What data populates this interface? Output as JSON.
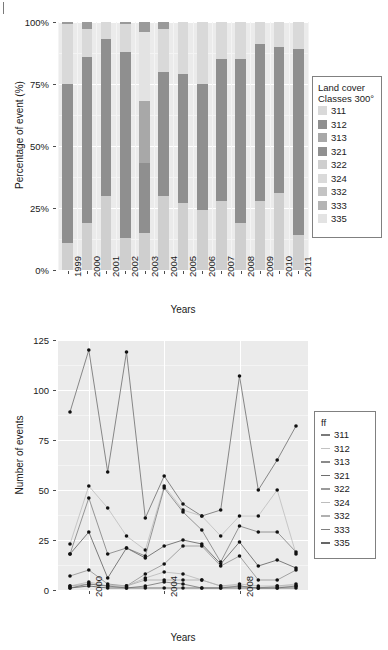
{
  "figure": {
    "corner_mark": "|"
  },
  "bar_chart": {
    "ylabel": "Percentage of event (%)",
    "xlabel": "Years",
    "ytick_labels": [
      "0%",
      "25%",
      "50%",
      "75%",
      "100%"
    ],
    "legend": {
      "title_line1": "Land cover",
      "title_line2": "Classes 300°",
      "items": [
        {
          "label": "311",
          "color": "#d9d9d9"
        },
        {
          "label": "312",
          "color": "#8f8f8f"
        },
        {
          "label": "313",
          "color": "#a8a8a8"
        },
        {
          "label": "321",
          "color": "#909090"
        },
        {
          "label": "322",
          "color": "#cfcfcf"
        },
        {
          "label": "324",
          "color": "#dadada"
        },
        {
          "label": "332",
          "color": "#c4c4c4"
        },
        {
          "label": "333",
          "color": "#b4b4b4"
        },
        {
          "label": "335",
          "color": "#e3e3e3"
        }
      ]
    }
  },
  "line_chart": {
    "ylabel": "Number of events",
    "xlabel": "Years",
    "ytick_labels": [
      "0",
      "25",
      "50",
      "75",
      "100",
      "125"
    ],
    "xtick_labels": [
      "2000",
      "2004",
      "2008"
    ],
    "legend": {
      "title": "ff",
      "items": [
        {
          "label": "311",
          "color": "#7a7a7a"
        },
        {
          "label": "312",
          "color": "#c2c2c2"
        },
        {
          "label": "313",
          "color": "#8a8a8a"
        },
        {
          "label": "321",
          "color": "#6e6e6e"
        },
        {
          "label": "322",
          "color": "#9a9a9a"
        },
        {
          "label": "324",
          "color": "#bdbdbd"
        },
        {
          "label": "332",
          "color": "#b0b0b0"
        },
        {
          "label": "333",
          "color": "#7f7f7f"
        },
        {
          "label": "335",
          "color": "#666666"
        }
      ]
    }
  },
  "chart_data": [
    {
      "type": "bar",
      "id": "stacked-percent-bar",
      "title": "",
      "xlabel": "Years",
      "ylabel": "Percentage of event (%)",
      "ylim": [
        0,
        100
      ],
      "ytick_values": [
        0,
        25,
        50,
        75,
        100
      ],
      "grid": true,
      "legend_position": "right",
      "stacked": true,
      "normalized_percent": true,
      "categories": [
        "1999",
        "2000",
        "2001",
        "2002",
        "2003",
        "2004",
        "2005",
        "2006",
        "2007",
        "2008",
        "2009",
        "2010",
        "2011"
      ],
      "series": [
        {
          "name": "311",
          "color": "#d9d9d9",
          "values": [
            11,
            5,
            5,
            5,
            8,
            6,
            5,
            5,
            5,
            5,
            5,
            5,
            5
          ]
        },
        {
          "name": "312",
          "color": "#8f8f8f",
          "values": [
            64,
            67,
            62,
            56,
            28,
            50,
            52,
            51,
            57,
            65,
            62,
            59,
            75
          ]
        },
        {
          "name": "313",
          "color": "#a8a8a8",
          "values": [
            3,
            3,
            3,
            3,
            3,
            3,
            3,
            3,
            3,
            3,
            3,
            3,
            3
          ]
        },
        {
          "name": "321",
          "color": "#909090",
          "values": [
            2,
            2,
            2,
            2,
            2,
            2,
            2,
            2,
            2,
            2,
            2,
            2,
            2
          ]
        },
        {
          "name": "322",
          "color": "#cfcfcf",
          "values": [
            4,
            4,
            4,
            4,
            4,
            4,
            4,
            4,
            4,
            4,
            4,
            4,
            4
          ]
        },
        {
          "name": "324",
          "color": "#dadada",
          "values": [
            5,
            5,
            5,
            5,
            17,
            10,
            10,
            10,
            8,
            5,
            6,
            8,
            3
          ]
        },
        {
          "name": "332",
          "color": "#c4c4c4",
          "values": [
            4,
            4,
            4,
            4,
            10,
            7,
            7,
            7,
            6,
            4,
            4,
            4,
            3
          ]
        },
        {
          "name": "333",
          "color": "#b4b4b4",
          "values": [
            3,
            3,
            3,
            3,
            8,
            6,
            5,
            5,
            4,
            3,
            3,
            3,
            2
          ]
        },
        {
          "name": "335",
          "color": "#e3e3e3",
          "values": [
            4,
            7,
            12,
            18,
            20,
            12,
            12,
            13,
            11,
            9,
            11,
            12,
            3
          ]
        }
      ],
      "bar_segments": {
        "1999": [
          [
            0,
            11,
            "#cfcfcf"
          ],
          [
            11,
            75,
            "#8f8f8f"
          ],
          [
            75,
            99,
            "#d9d9d9"
          ],
          [
            99,
            100,
            "#9a9a9a"
          ]
        ],
        "2000": [
          [
            0,
            19,
            "#cfcfcf"
          ],
          [
            19,
            86,
            "#8f8f8f"
          ],
          [
            86,
            97,
            "#d9d9d9"
          ],
          [
            97,
            100,
            "#9a9a9a"
          ]
        ],
        "2001": [
          [
            0,
            30,
            "#cfcfcf"
          ],
          [
            30,
            93,
            "#8f8f8f"
          ],
          [
            93,
            100,
            "#d9d9d9"
          ]
        ],
        "2002": [
          [
            0,
            13,
            "#cfcfcf"
          ],
          [
            13,
            88,
            "#8f8f8f"
          ],
          [
            88,
            99,
            "#d9d9d9"
          ],
          [
            99,
            100,
            "#9a9a9a"
          ]
        ],
        "2003": [
          [
            0,
            15,
            "#cfcfcf"
          ],
          [
            15,
            43,
            "#8f8f8f"
          ],
          [
            43,
            68,
            "#a8a8a8"
          ],
          [
            68,
            96,
            "#e3e3e3"
          ],
          [
            96,
            100,
            "#9a9a9a"
          ]
        ],
        "2004": [
          [
            0,
            30,
            "#cfcfcf"
          ],
          [
            30,
            80,
            "#8f8f8f"
          ],
          [
            80,
            97,
            "#d9d9d9"
          ],
          [
            97,
            100,
            "#9a9a9a"
          ]
        ],
        "2005": [
          [
            0,
            27,
            "#cfcfcf"
          ],
          [
            27,
            79,
            "#8f8f8f"
          ],
          [
            79,
            100,
            "#d9d9d9"
          ]
        ],
        "2006": [
          [
            0,
            24,
            "#cfcfcf"
          ],
          [
            24,
            75,
            "#8f8f8f"
          ],
          [
            75,
            100,
            "#d9d9d9"
          ]
        ],
        "2007": [
          [
            0,
            28,
            "#cfcfcf"
          ],
          [
            28,
            85,
            "#8f8f8f"
          ],
          [
            85,
            100,
            "#d9d9d9"
          ]
        ],
        "2008": [
          [
            0,
            19,
            "#cfcfcf"
          ],
          [
            19,
            85,
            "#8f8f8f"
          ],
          [
            85,
            100,
            "#d9d9d9"
          ]
        ],
        "2009": [
          [
            0,
            28,
            "#cfcfcf"
          ],
          [
            28,
            91,
            "#8f8f8f"
          ],
          [
            91,
            100,
            "#d9d9d9"
          ]
        ],
        "2010": [
          [
            0,
            31,
            "#cfcfcf"
          ],
          [
            31,
            90,
            "#8f8f8f"
          ],
          [
            90,
            100,
            "#d9d9d9"
          ]
        ],
        "2011": [
          [
            0,
            14,
            "#cfcfcf"
          ],
          [
            14,
            89,
            "#8f8f8f"
          ],
          [
            89,
            100,
            "#d9d9d9"
          ]
        ]
      }
    },
    {
      "type": "line",
      "id": "events-per-year-lines",
      "title": "",
      "xlabel": "Years",
      "ylabel": "Number of events",
      "ylim": [
        0,
        125
      ],
      "ytick_values": [
        0,
        25,
        50,
        75,
        100,
        125
      ],
      "xtick_values": [
        2000,
        2004,
        2008
      ],
      "xlim": [
        1999,
        2011
      ],
      "grid": true,
      "legend_position": "right",
      "markers": true,
      "x": [
        1999,
        2000,
        2001,
        2002,
        2003,
        2004,
        2005,
        2006,
        2007,
        2008,
        2009,
        2010,
        2011
      ],
      "series": [
        {
          "name": "311",
          "color": "#7a7a7a",
          "values": [
            89,
            120,
            59,
            119,
            36,
            57,
            43,
            37,
            40,
            107,
            50,
            65,
            82
          ]
        },
        {
          "name": "312",
          "color": "#c2c2c2",
          "values": [
            23,
            52,
            41,
            27,
            20,
            52,
            40,
            37,
            27,
            37,
            37,
            50,
            18
          ]
        },
        {
          "name": "313",
          "color": "#8a8a8a",
          "values": [
            18,
            46,
            18,
            21,
            17,
            51,
            39,
            30,
            14,
            32,
            29,
            29,
            19
          ]
        },
        {
          "name": "321",
          "color": "#6e6e6e",
          "values": [
            18,
            29,
            6,
            21,
            16,
            22,
            25,
            23,
            13,
            24,
            12,
            15,
            11
          ]
        },
        {
          "name": "322",
          "color": "#9a9a9a",
          "values": [
            7,
            10,
            3,
            2,
            8,
            13,
            22,
            22,
            12,
            17,
            5,
            5,
            10
          ]
        },
        {
          "name": "324",
          "color": "#bdbdbd",
          "values": [
            2,
            4,
            2,
            2,
            6,
            9,
            8,
            5,
            2,
            3,
            2,
            2,
            3
          ]
        },
        {
          "name": "332",
          "color": "#b0b0b0",
          "values": [
            2,
            3,
            2,
            2,
            5,
            5,
            5,
            5,
            2,
            2,
            1,
            2,
            2
          ]
        },
        {
          "name": "333",
          "color": "#7f7f7f",
          "values": [
            1,
            3,
            2,
            1,
            2,
            4,
            3,
            1,
            1,
            2,
            1,
            1,
            2
          ]
        },
        {
          "name": "335",
          "color": "#666666",
          "values": [
            1,
            2,
            1,
            1,
            1,
            1,
            1,
            1,
            1,
            1,
            1,
            1,
            1
          ]
        }
      ]
    }
  ]
}
